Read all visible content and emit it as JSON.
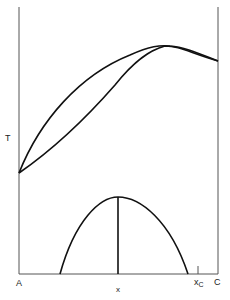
{
  "diagram": {
    "type": "phase-diagram",
    "axis_labels": {
      "y": "T",
      "x": "x",
      "left_end": "A",
      "right_end": "C",
      "marker": "x",
      "marker_sub": "C"
    },
    "colors": {
      "line": "#111111",
      "axis": "#555555",
      "background": "#ffffff"
    }
  }
}
